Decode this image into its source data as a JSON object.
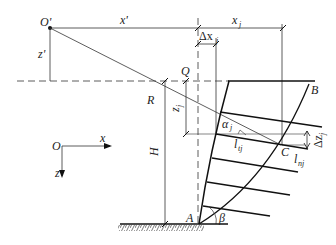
{
  "diagram": {
    "type": "geotechnical slope geometry",
    "labels": {
      "origin_prime": "O'",
      "x_prime": "x'",
      "z_prime": "z'",
      "x_j": "x",
      "x_j_sub": "j",
      "delta_x_j": "Δx",
      "delta_x_j_sub": "j",
      "Q": "Q",
      "R": "R",
      "B": "B",
      "z_j": "z",
      "z_j_sub": "j",
      "alpha_j": "α",
      "alpha_j_sub": "j",
      "l_tj": "l",
      "l_tj_sub": "tj",
      "C": "C",
      "delta_z_j": "Δz",
      "delta_z_j_sub": "j",
      "l_nj": "l",
      "l_nj_sub": "nj",
      "H": "H",
      "A": "A",
      "beta": "β",
      "origin": "O",
      "x_axis": "x",
      "z_axis": "z"
    },
    "colors": {
      "line": "#222222",
      "background": "#ffffff"
    }
  }
}
